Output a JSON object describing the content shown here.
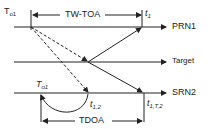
{
  "diagram": {
    "lines": [
      {
        "id": "prn1",
        "label": "PRN1"
      },
      {
        "id": "target",
        "label": "Target"
      },
      {
        "id": "srn2",
        "label": "SRN2"
      }
    ],
    "labels": {
      "t_o1": "T",
      "t_o1_sub": "o1",
      "tw_toa": "TW-TOA",
      "t1_hat": "t",
      "t1_hat_sub": "1",
      "t_o1_hat": "T",
      "t_o1_hat_sub": "o1",
      "t12_hat": "t",
      "t12_hat_sub": "1,2",
      "t1t2_hat": "t",
      "t1t2_hat_sub": "1,T,2",
      "tdoa": "TDOA",
      "hat": "^"
    },
    "colors": {
      "stroke": "#222222",
      "background": "#ffffff"
    }
  }
}
